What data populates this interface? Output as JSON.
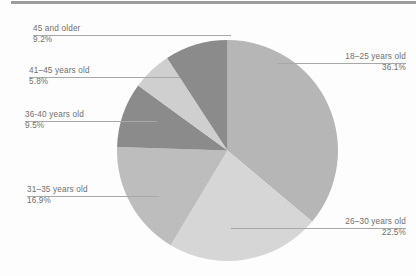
{
  "chart_data": {
    "type": "pie",
    "title": "",
    "subtitle": "",
    "xlabel": "",
    "ylabel": "",
    "legend_position": "none",
    "grid": false,
    "units": "percent",
    "start_angle_deg": 0,
    "direction": "clockwise",
    "categories": [
      "18–25 years old",
      "26–30 years old",
      "31–35 years old",
      "36-40 years old",
      "41–45 years old",
      "45 and older"
    ],
    "values": [
      36.1,
      22.5,
      16.9,
      9.5,
      5.8,
      9.2
    ],
    "slices": [
      {
        "label": "18–25 years old",
        "percent_text": "36.1%",
        "value": 36.1,
        "color": "#b6b6b6",
        "label_side": "right",
        "label_align": "right"
      },
      {
        "label": "26–30 years old",
        "percent_text": "22.5%",
        "value": 22.5,
        "color": "#d6d6d6",
        "label_side": "right",
        "label_align": "right"
      },
      {
        "label": "31–35 years old",
        "percent_text": "16.9%",
        "value": 16.9,
        "color": "#bdbdbd",
        "label_side": "left",
        "label_align": "left"
      },
      {
        "label": "36-40 years old",
        "percent_text": "9.5%",
        "value": 9.5,
        "color": "#8b8b8b",
        "label_side": "left",
        "label_align": "left"
      },
      {
        "label": "41–45 years old",
        "percent_text": "5.8%",
        "value": 5.8,
        "color": "#cfcfcf",
        "label_side": "left",
        "label_align": "left"
      },
      {
        "label": "45 and older",
        "percent_text": "9.2%",
        "value": 9.2,
        "color": "#8b8b8b",
        "label_side": "left",
        "label_align": "left"
      }
    ],
    "colors": {
      "medium_gray": "#b6b6b6",
      "light_gray": "#d6d6d6",
      "medium_gray_alt": "#bdbdbd",
      "dark_gray": "#8b8b8b",
      "pale_gray": "#cfcfcf",
      "label_text": "#6f6f6f",
      "leader_line": "#a8a8a8",
      "top_rule": "#9d9d9d",
      "background": "#fdfdfd"
    }
  }
}
